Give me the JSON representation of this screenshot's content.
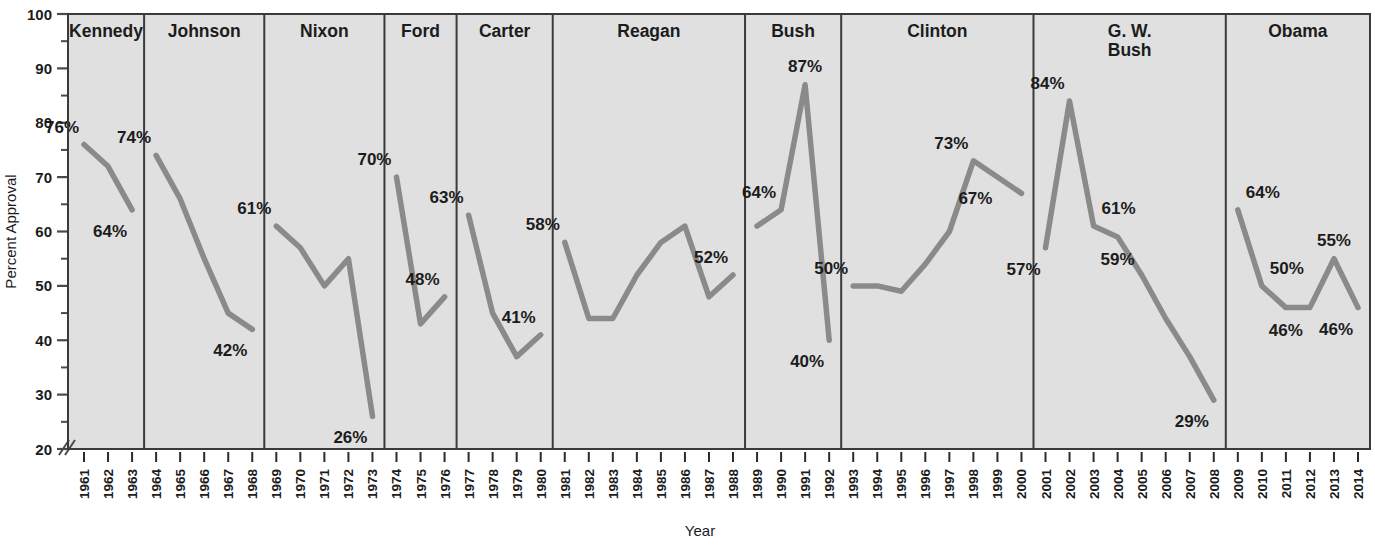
{
  "chart_data": {
    "type": "line",
    "title": "",
    "xlabel": "Year",
    "ylabel": "Percent Approval",
    "ylim": [
      20,
      100
    ],
    "yticks": [
      20,
      30,
      40,
      50,
      60,
      70,
      80,
      90,
      100
    ],
    "ytick_labels": [
      "20",
      "30",
      "40",
      "50",
      "60",
      "70",
      "80",
      "90",
      "100"
    ],
    "y_minor_ticks": [
      25,
      35,
      45,
      55,
      65,
      75,
      85,
      95
    ],
    "axis_break": true,
    "grid": false,
    "legend": "none",
    "panel_background": "#e0e0e0",
    "line_color": "#8a8a8a",
    "border_color": "#4a4a4a",
    "text_color": "#1c1c1c",
    "x": [
      1961,
      1962,
      1963,
      1964,
      1965,
      1966,
      1967,
      1968,
      1969,
      1970,
      1971,
      1972,
      1973,
      1974,
      1975,
      1976,
      1977,
      1978,
      1979,
      1980,
      1981,
      1982,
      1983,
      1984,
      1985,
      1986,
      1987,
      1988,
      1989,
      1990,
      1991,
      1992,
      1993,
      1994,
      1995,
      1996,
      1997,
      1998,
      1999,
      2000,
      2001,
      2002,
      2003,
      2004,
      2005,
      2006,
      2007,
      2008,
      2009,
      2010,
      2011,
      2012,
      2013,
      2014
    ],
    "xtick_labels": [
      "1961",
      "1962",
      "1963",
      "1964",
      "1965",
      "1966",
      "1967",
      "1968",
      "1969",
      "1970",
      "1971",
      "1972",
      "1973",
      "1974",
      "1975",
      "1976",
      "1977",
      "1978",
      "1979",
      "1980",
      "1981",
      "1982",
      "1983",
      "1984",
      "1985",
      "1986",
      "1987",
      "1988",
      "1989",
      "1990",
      "1991",
      "1992",
      "1993",
      "1994",
      "1995",
      "1996",
      "1997",
      "1998",
      "1999",
      "2000",
      "2001",
      "2002",
      "2003",
      "2004",
      "2005",
      "2006",
      "2007",
      "2008",
      "2009",
      "2010",
      "2011",
      "2012",
      "2013",
      "2014"
    ],
    "panels": [
      {
        "president": "Kennedy",
        "years": [
          1961,
          1962,
          1963
        ],
        "values": [
          76,
          72,
          64
        ],
        "annotations": [
          {
            "text": "76%",
            "year": 1961,
            "value": 76,
            "pos": "above-left"
          },
          {
            "text": "64%",
            "year": 1963,
            "value": 64,
            "pos": "below-left"
          }
        ]
      },
      {
        "president": "Johnson",
        "years": [
          1964,
          1965,
          1966,
          1967,
          1968
        ],
        "values": [
          74,
          66,
          55,
          45,
          42
        ],
        "annotations": [
          {
            "text": "74%",
            "year": 1964,
            "value": 74,
            "pos": "above-left"
          },
          {
            "text": "42%",
            "year": 1968,
            "value": 42,
            "pos": "below-left"
          }
        ]
      },
      {
        "president": "Nixon",
        "years": [
          1969,
          1970,
          1971,
          1972,
          1973
        ],
        "values": [
          61,
          57,
          50,
          55,
          26
        ],
        "annotations": [
          {
            "text": "61%",
            "year": 1969,
            "value": 61,
            "pos": "above-left"
          },
          {
            "text": "26%",
            "year": 1973,
            "value": 26,
            "pos": "below-left"
          }
        ]
      },
      {
        "president": "Ford",
        "years": [
          1974,
          1975,
          1976
        ],
        "values": [
          70,
          43,
          48
        ],
        "annotations": [
          {
            "text": "70%",
            "year": 1974,
            "value": 70,
            "pos": "above-left"
          },
          {
            "text": "48%",
            "year": 1976,
            "value": 48,
            "pos": "above-left"
          }
        ]
      },
      {
        "president": "Carter",
        "years": [
          1977,
          1978,
          1979,
          1980
        ],
        "values": [
          63,
          45,
          37,
          41
        ],
        "annotations": [
          {
            "text": "63%",
            "year": 1977,
            "value": 63,
            "pos": "above-left"
          },
          {
            "text": "41%",
            "year": 1980,
            "value": 41,
            "pos": "above-left"
          }
        ]
      },
      {
        "president": "Reagan",
        "years": [
          1981,
          1982,
          1983,
          1984,
          1985,
          1986,
          1987,
          1988
        ],
        "values": [
          58,
          44,
          44,
          52,
          58,
          61,
          48,
          52
        ],
        "annotations": [
          {
            "text": "58%",
            "year": 1981,
            "value": 58,
            "pos": "above-left"
          },
          {
            "text": "52%",
            "year": 1988,
            "value": 52,
            "pos": "above-left"
          }
        ]
      },
      {
        "president": "Bush",
        "years": [
          1989,
          1990,
          1991,
          1992
        ],
        "values": [
          61,
          64,
          87,
          40
        ],
        "annotations": [
          {
            "text": "64%",
            "year": 1990,
            "value": 64,
            "pos": "above-left"
          },
          {
            "text": "87%",
            "year": 1991,
            "value": 87,
            "pos": "above"
          },
          {
            "text": "40%",
            "year": 1992,
            "value": 40,
            "pos": "below-left"
          }
        ]
      },
      {
        "president": "Clinton",
        "years": [
          1993,
          1994,
          1995,
          1996,
          1997,
          1998,
          1999,
          2000
        ],
        "values": [
          50,
          50,
          49,
          54,
          60,
          73,
          70,
          67
        ],
        "annotations": [
          {
            "text": "50%",
            "year": 1993,
            "value": 50,
            "pos": "above-left"
          },
          {
            "text": "73%",
            "year": 1998,
            "value": 73,
            "pos": "above-left"
          },
          {
            "text": "67%",
            "year": 1999,
            "value": 70,
            "pos": "below-left"
          }
        ]
      },
      {
        "president": "G. W. Bush",
        "president_lines": [
          "G. W.",
          "Bush"
        ],
        "years": [
          2001,
          2002,
          2003,
          2004,
          2005,
          2006,
          2007,
          2008
        ],
        "values": [
          57,
          84,
          61,
          59,
          52,
          44,
          37,
          29
        ],
        "annotations": [
          {
            "text": "84%",
            "year": 2002,
            "value": 84,
            "pos": "above-left"
          },
          {
            "text": "61%",
            "year": 2003,
            "value": 61,
            "pos": "above-right"
          },
          {
            "text": "59%",
            "year": 2004,
            "value": 59,
            "pos": "below"
          },
          {
            "text": "57%",
            "year": 2001,
            "value": 57,
            "pos": "below-left"
          },
          {
            "text": "29%",
            "year": 2008,
            "value": 29,
            "pos": "below-left"
          }
        ]
      },
      {
        "president": "Obama",
        "years": [
          2009,
          2010,
          2011,
          2012,
          2013,
          2014
        ],
        "values": [
          64,
          50,
          46,
          46,
          55,
          46
        ],
        "annotations": [
          {
            "text": "64%",
            "year": 2009,
            "value": 64,
            "pos": "above-right"
          },
          {
            "text": "50%",
            "year": 2010,
            "value": 50,
            "pos": "above-right"
          },
          {
            "text": "46%",
            "year": 2011,
            "value": 46,
            "pos": "below"
          },
          {
            "text": "55%",
            "year": 2013,
            "value": 55,
            "pos": "above"
          },
          {
            "text": "46%",
            "year": 2014,
            "value": 46,
            "pos": "below-left"
          }
        ]
      }
    ]
  }
}
